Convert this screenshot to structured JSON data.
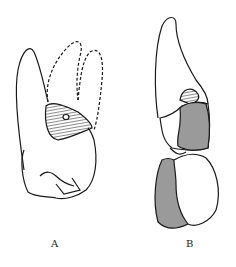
{
  "figure": {
    "panels": [
      {
        "id": "A",
        "label": "A"
      },
      {
        "id": "B",
        "label": "B"
      }
    ],
    "colors": {
      "line": "#1a1a1a",
      "shade": "#9a9a9a",
      "background": "#ffffff"
    }
  }
}
